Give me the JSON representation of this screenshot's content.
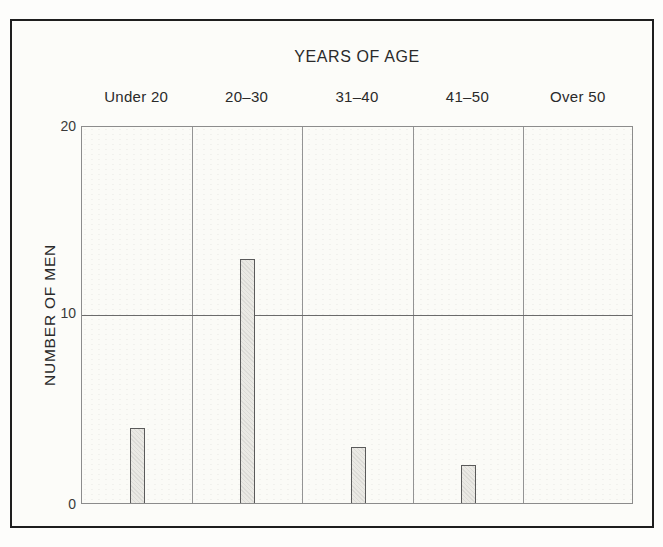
{
  "chart_data": {
    "type": "bar",
    "title": "YEARS OF AGE",
    "xlabel": "",
    "ylabel": "NUMBER OF MEN",
    "categories": [
      "Under 20",
      "20–30",
      "31–40",
      "41–50",
      "Over 50"
    ],
    "values": [
      4,
      13,
      3,
      2,
      0
    ],
    "ylim": [
      0,
      20
    ],
    "yticks": [
      0,
      10,
      20
    ],
    "grid": "single horizontal gridline at y=10; vertical separator lines between category columns",
    "legend_position": "none",
    "bar_style": "narrow light-gray hatched bars centered in each category column"
  },
  "axis": {
    "tick_labels": [
      "20",
      "10",
      "0"
    ]
  },
  "colors": {
    "outer_frame": "#1e1e1e",
    "plot_border": "#8c8c8c",
    "separator_line": "#949494",
    "gridline": "#6b6b6b",
    "bar_fill": "#eae9e4",
    "bar_border": "#5a5a5a",
    "text": "#2a2a2a",
    "page_background": "#fdfdfb"
  }
}
